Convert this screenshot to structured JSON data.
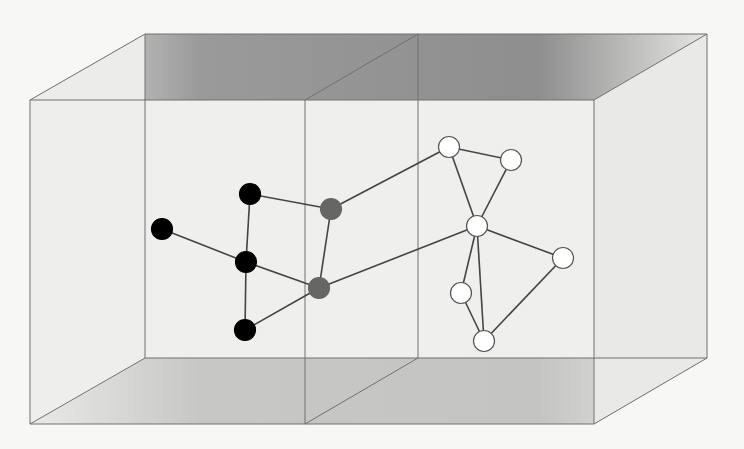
{
  "diagram": {
    "type": "3d-box-network",
    "box": {
      "front": {
        "tl": [
          30,
          100
        ],
        "tr": [
          594,
          100
        ],
        "br": [
          594,
          424
        ],
        "bl": [
          30,
          424
        ]
      },
      "back": {
        "tl": [
          145,
          34
        ],
        "tr": [
          707,
          34
        ],
        "br": [
          707,
          358
        ],
        "bl": [
          145,
          358
        ]
      },
      "divider": {
        "front_x": 305,
        "back_x": 418
      }
    },
    "colors": {
      "background": "#f7f7f5",
      "panel": "#eeeeec",
      "face_dark": "#8f8f8f",
      "face_light": "#e2e2e0",
      "edge": "#707070",
      "node_black": "#000000",
      "node_gray": "#666666",
      "node_white": "#ffffff",
      "link": "#444444"
    },
    "nodes": [
      {
        "id": "a",
        "x": 162,
        "y": 229,
        "group": "black"
      },
      {
        "id": "b",
        "x": 250,
        "y": 194,
        "group": "black"
      },
      {
        "id": "c",
        "x": 246,
        "y": 262,
        "group": "black"
      },
      {
        "id": "d",
        "x": 245,
        "y": 330,
        "group": "black"
      },
      {
        "id": "e",
        "x": 331,
        "y": 209,
        "group": "gray"
      },
      {
        "id": "f",
        "x": 319,
        "y": 288,
        "group": "gray"
      },
      {
        "id": "g",
        "x": 449,
        "y": 147,
        "group": "white"
      },
      {
        "id": "h",
        "x": 511,
        "y": 160,
        "group": "white"
      },
      {
        "id": "i",
        "x": 477,
        "y": 226,
        "group": "white"
      },
      {
        "id": "j",
        "x": 563,
        "y": 258,
        "group": "white"
      },
      {
        "id": "k",
        "x": 461,
        "y": 293,
        "group": "white"
      },
      {
        "id": "l",
        "x": 484,
        "y": 341,
        "group": "white"
      }
    ],
    "edges": [
      [
        "a",
        "c"
      ],
      [
        "b",
        "c"
      ],
      [
        "c",
        "d"
      ],
      [
        "b",
        "e"
      ],
      [
        "c",
        "f"
      ],
      [
        "d",
        "f"
      ],
      [
        "e",
        "f"
      ],
      [
        "e",
        "g"
      ],
      [
        "f",
        "i"
      ],
      [
        "g",
        "h"
      ],
      [
        "g",
        "i"
      ],
      [
        "h",
        "i"
      ],
      [
        "i",
        "j"
      ],
      [
        "i",
        "k"
      ],
      [
        "i",
        "l"
      ],
      [
        "k",
        "l"
      ],
      [
        "j",
        "l"
      ]
    ]
  }
}
